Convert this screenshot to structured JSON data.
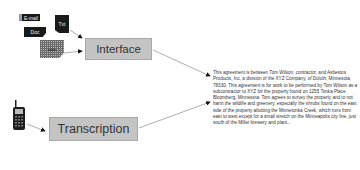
{
  "diagram": {
    "inputs": {
      "email_label": "E-mail",
      "doc_label": "Doc",
      "txt_label": "Txt",
      "table_label": "table"
    },
    "nodes": {
      "interface": "Interface",
      "transcription": "Transcription"
    },
    "output_text": "This agreement is between Tom Wilson, contractor, and Asbestos Products, Inc, a division of the XYZ Company, of Duluth, Minnesota, 78330. This agreement is for work to be performed by Tom Wilson as a subcontractor to XYZ for the property found on 1255 Tonka Place, Bloomberg, Minnesota. Tom agrees to survey the property and to not harm the wildlife and greenery, especially the shrubs found on the east side of the property abutting the Minnetonka Creek, which runs from east to west except for a small stretch on the Minneapolis city line, just south of the Miller brewery and plant...",
    "colors": {
      "box_fill": "#c4c4c4",
      "icon_dark": "#1a1a1a",
      "arrow": "#999999",
      "text": "#333333"
    }
  }
}
